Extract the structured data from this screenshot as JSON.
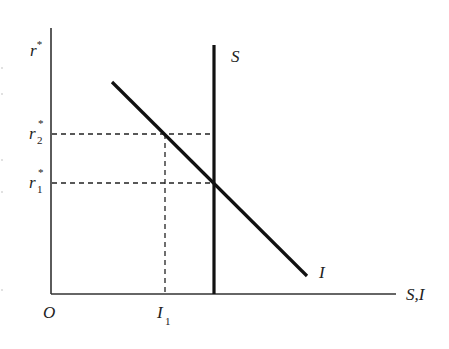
{
  "diagram": {
    "y_axis_label": "r",
    "y_axis_label_sup": "*",
    "x_axis_label": "S,I",
    "origin_label": "O",
    "curves": [
      {
        "name": "S",
        "label": "S",
        "type": "vertical"
      },
      {
        "name": "I",
        "label": "I",
        "type": "downward-sloping"
      }
    ],
    "y_ticks": [
      {
        "base": "r",
        "sup": "*",
        "sub": "2"
      },
      {
        "base": "r",
        "sup": "*",
        "sub": "1"
      }
    ],
    "x_ticks": [
      {
        "base": "I",
        "sub": "1"
      }
    ]
  }
}
